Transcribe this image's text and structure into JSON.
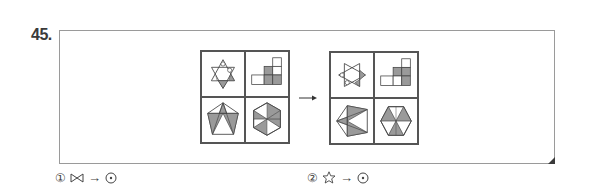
{
  "question": {
    "number": "45."
  },
  "figure": {
    "arrow_symbol": "→",
    "left_grid": {
      "cells": [
        {
          "position": "top-left",
          "shape": "hexagram with circles and shaded triangles"
        },
        {
          "position": "top-right",
          "shape": "staircase of squares with shaded squares"
        },
        {
          "position": "bottom-left",
          "shape": "pentagon with inscribed triangle, shaded regions"
        },
        {
          "position": "bottom-right",
          "shape": "hexagon with diagonals, shaded triangles"
        }
      ]
    },
    "right_grid": {
      "cells": [
        {
          "position": "top-left",
          "shape": "rotated hexagram with circles and shaded triangle"
        },
        {
          "position": "top-right",
          "shape": "staircase of squares with shaded squares"
        },
        {
          "position": "bottom-left",
          "shape": "rotated pentagon with shaded triangles"
        },
        {
          "position": "bottom-right",
          "shape": "hexagon with diagonals, shaded triangles"
        }
      ]
    }
  },
  "options": [
    {
      "number": "①",
      "symbol_from": "bowtie",
      "arrow": "→",
      "symbol_to": "circled-dot"
    },
    {
      "number": "②",
      "symbol_from": "star-outline",
      "arrow": "→",
      "symbol_to": "circled-dot"
    }
  ],
  "colors": {
    "line": "#555555",
    "shade": "#9a9a9a",
    "frame": "#9a9a9a",
    "fold": "#3a3a3a"
  }
}
